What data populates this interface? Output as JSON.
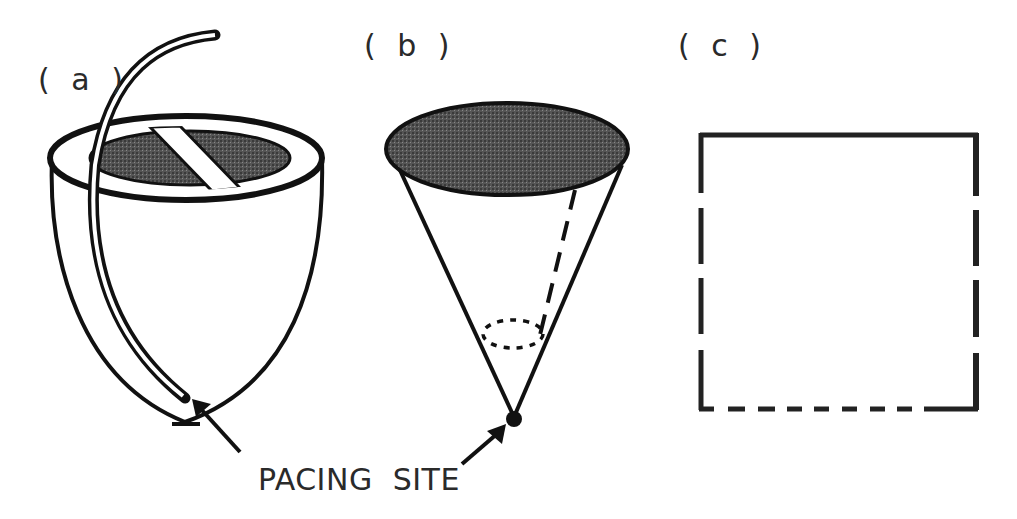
{
  "figure": {
    "panels": [
      {
        "id": "a",
        "label": "( a )",
        "description": "heart ventricle with pacing lead"
      },
      {
        "id": "b",
        "label": "( b )",
        "description": "conical ventricle model with apex pacing site"
      },
      {
        "id": "c",
        "label": "( c )",
        "description": "2D square domain with mixed boundary conditions"
      }
    ],
    "caption": {
      "pacing_site": "PACING  SITE"
    },
    "colors": {
      "stroke": "#111111",
      "shade": "#4a4a4a",
      "text": "#2a2a2a",
      "background": "#ffffff"
    },
    "panel_c_edges": {
      "top": "solid",
      "left": "long-dash",
      "right": "long-dash",
      "bottom": "short-dash"
    }
  }
}
